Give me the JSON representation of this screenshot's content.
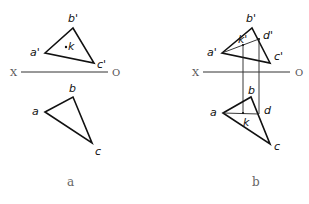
{
  "panels": [
    {
      "caption": "a",
      "axis": {
        "left_label": "X",
        "right_label": "O"
      },
      "front_view": {
        "labels": {
          "a": "a'",
          "b": "b'",
          "c": "c'",
          "k": "k"
        }
      },
      "top_view": {
        "labels": {
          "a": "a",
          "b": "b",
          "c": "c"
        }
      }
    },
    {
      "caption": "b",
      "axis": {
        "left_label": "X",
        "right_label": "O"
      },
      "front_view": {
        "labels": {
          "a": "a'",
          "b": "b'",
          "c": "c'",
          "d": "d'",
          "k": "k'"
        }
      },
      "top_view": {
        "labels": {
          "a": "a",
          "b": "b",
          "c": "c",
          "d": "d",
          "k": "k"
        }
      }
    }
  ]
}
